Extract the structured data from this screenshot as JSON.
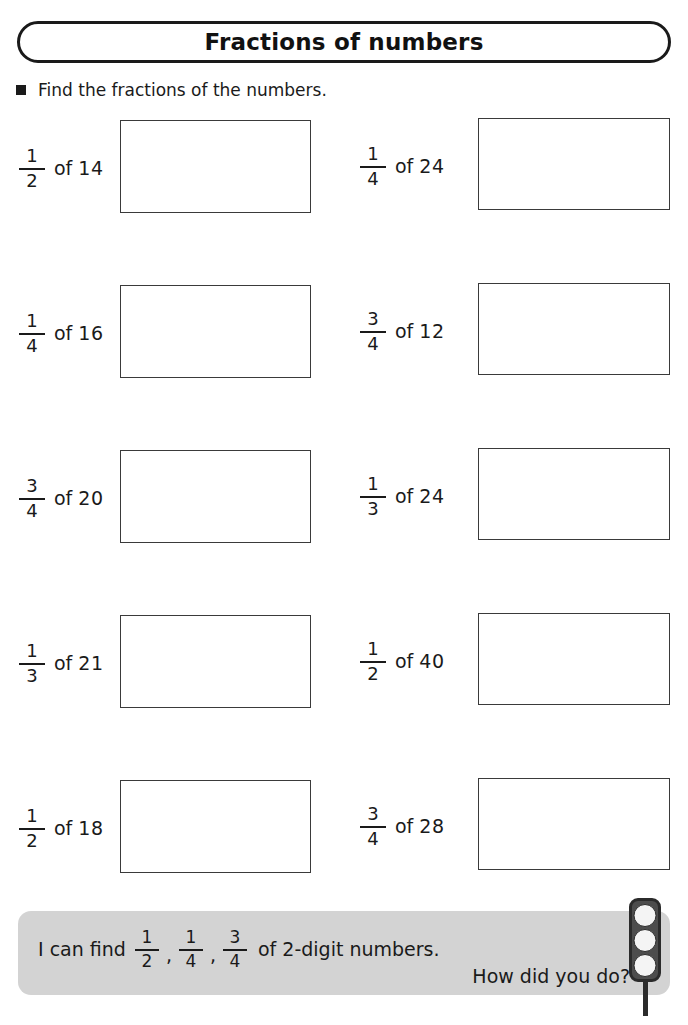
{
  "title": {
    "text": "Fractions of numbers"
  },
  "instruction": {
    "bullet": "square-bullet-icon",
    "text": "Find the fractions of the numbers."
  },
  "problems": [
    {
      "left": {
        "numerator": "1",
        "denominator": "2",
        "of": "of",
        "number": "14",
        "answer": ""
      },
      "right": {
        "numerator": "1",
        "denominator": "4",
        "of": "of",
        "number": "24",
        "answer": ""
      }
    },
    {
      "left": {
        "numerator": "1",
        "denominator": "4",
        "of": "of",
        "number": "16",
        "answer": ""
      },
      "right": {
        "numerator": "3",
        "denominator": "4",
        "of": "of",
        "number": "12",
        "answer": ""
      }
    },
    {
      "left": {
        "numerator": "3",
        "denominator": "4",
        "of": "of",
        "number": "20",
        "answer": ""
      },
      "right": {
        "numerator": "1",
        "denominator": "3",
        "of": "of",
        "number": "24",
        "answer": ""
      }
    },
    {
      "left": {
        "numerator": "1",
        "denominator": "3",
        "of": "of",
        "number": "21",
        "answer": ""
      },
      "right": {
        "numerator": "1",
        "denominator": "2",
        "of": "of",
        "number": "40",
        "answer": ""
      }
    },
    {
      "left": {
        "numerator": "1",
        "denominator": "2",
        "of": "of",
        "number": "18",
        "answer": ""
      },
      "right": {
        "numerator": "3",
        "denominator": "4",
        "of": "of",
        "number": "28",
        "answer": ""
      }
    }
  ],
  "footer": {
    "lead": "I can find",
    "fractions": [
      {
        "numerator": "1",
        "denominator": "2"
      },
      {
        "numerator": "1",
        "denominator": "4"
      },
      {
        "numerator": "3",
        "denominator": "4"
      }
    ],
    "separator": ",",
    "tail": "of 2-digit numbers.",
    "question": "How did you do?",
    "traffic_light": "traffic-light-icon",
    "background_color": "#d3d3d3"
  }
}
